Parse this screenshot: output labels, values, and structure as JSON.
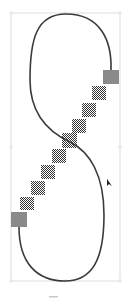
{
  "editor": {
    "tool": "path-edit",
    "selection_box": {
      "x": 11,
      "y": 13,
      "width": 109,
      "height": 268,
      "color": "#d4d4d4"
    },
    "path": {
      "stroke": "#3a3a3a",
      "stroke_width": 1.6
    },
    "anchor_handles": [
      {
        "id": "handle-top-right",
        "x": 103,
        "y": 70,
        "size": 15,
        "color": "#8a8a8a"
      },
      {
        "id": "handle-bottom-left",
        "x": 11,
        "y": 212,
        "size": 15,
        "color": "#8a8a8a"
      }
    ],
    "control_points": [
      {
        "x": 92,
        "y": 86
      },
      {
        "x": 82,
        "y": 103
      },
      {
        "x": 72,
        "y": 119
      },
      {
        "x": 62,
        "y": 132
      },
      {
        "x": 52,
        "y": 148
      },
      {
        "x": 41,
        "y": 164
      },
      {
        "x": 30,
        "y": 180
      },
      {
        "x": 20,
        "y": 196
      }
    ],
    "control_point_size": 14,
    "cursor": {
      "x": 107,
      "y": 180
    }
  },
  "footer": {
    "label": ""
  }
}
